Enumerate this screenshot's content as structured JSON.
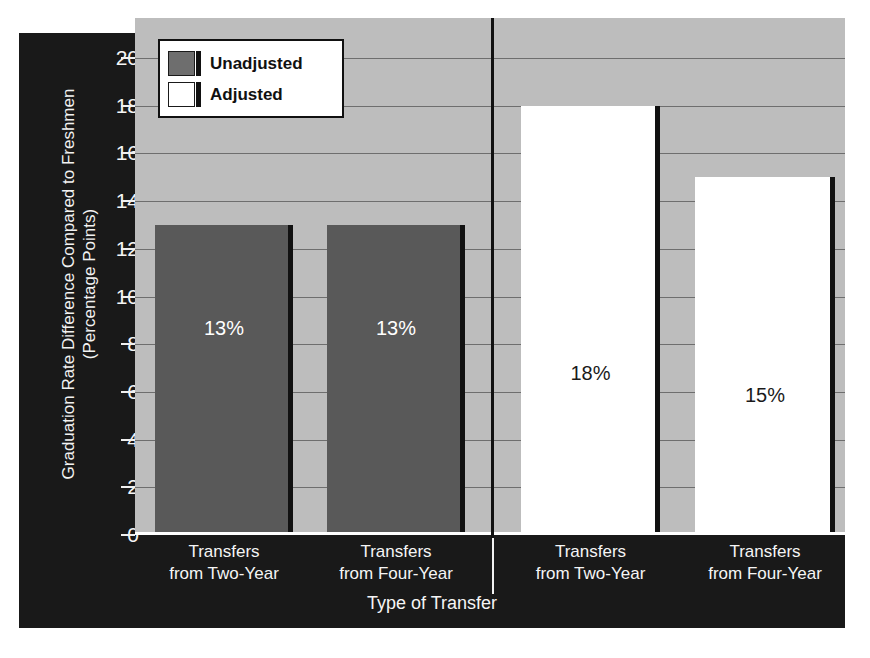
{
  "chart_data": {
    "type": "bar",
    "title": "",
    "xlabel": "Type of Transfer",
    "ylabel_line1": "Graduation Rate Difference Compared to Freshmen",
    "ylabel_line2": "(Percentage Points)",
    "ylim": [
      0,
      20
    ],
    "ytick_labels": [
      "20",
      "18",
      "16",
      "14",
      "12",
      "10",
      "8",
      "6",
      "4",
      "2",
      "0"
    ],
    "ytick_values": [
      20,
      18,
      16,
      14,
      12,
      10,
      8,
      6,
      4,
      2,
      0
    ],
    "grid": true,
    "legend_position": "upper-left-inside",
    "legend": [
      {
        "label": "Unadjusted",
        "swatch": "dark"
      },
      {
        "label": "Adjusted",
        "swatch": "light"
      }
    ],
    "groups": [
      {
        "name": "Unadjusted",
        "divider_after": true
      },
      {
        "name": "Adjusted",
        "divider_after": false
      }
    ],
    "categories": [
      "Transfers from Two-Year",
      "Transfers from Four-Year",
      "Transfers from Two-Year",
      "Transfers from Four-Year"
    ],
    "bars": [
      {
        "group": "Unadjusted",
        "category_line1": "Transfers",
        "category_line2": "from Two-Year",
        "value": 13,
        "data_label": "13%",
        "fill": "#595959",
        "style": "unadjusted"
      },
      {
        "group": "Unadjusted",
        "category_line1": "Transfers",
        "category_line2": "from Four-Year",
        "value": 13,
        "data_label": "13%",
        "fill": "#595959",
        "style": "unadjusted"
      },
      {
        "group": "Adjusted",
        "category_line1": "Transfers",
        "category_line2": "from Two-Year",
        "value": 18,
        "data_label": "18%",
        "fill": "#ffffff",
        "style": "adjusted"
      },
      {
        "group": "Adjusted",
        "category_line1": "Transfers",
        "category_line2": "from Four-Year",
        "value": 15,
        "data_label": "15%",
        "fill": "#ffffff",
        "style": "adjusted"
      }
    ],
    "colors": {
      "panel_background": "#191919",
      "plot_background": "#bdbdbd",
      "gridline": "#6e6e6e",
      "unadjusted_bar": "#595959",
      "adjusted_bar": "#ffffff",
      "bar_edge": "#111111",
      "axis_text": "#f5f5f5"
    }
  },
  "axis": {
    "ticks": [
      {
        "label": "20"
      },
      {
        "label": "18"
      },
      {
        "label": "16"
      },
      {
        "label": "14"
      },
      {
        "label": "12"
      },
      {
        "label": "10"
      },
      {
        "label": "8"
      },
      {
        "label": "6"
      },
      {
        "label": "4"
      },
      {
        "label": "2"
      },
      {
        "label": "0"
      }
    ]
  }
}
